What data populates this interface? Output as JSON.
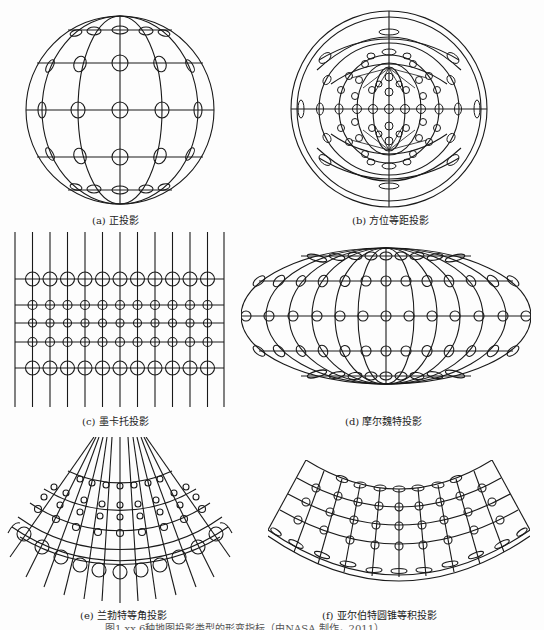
{
  "figure": {
    "caption_partial": "图1.xx 6种地图投影类型的形变指标（由NASA 制作，2011）",
    "stroke_color": "#1a1a1a",
    "background": "#fdfdfd"
  },
  "panels": [
    {
      "id": "a",
      "label": "(a) 正投影",
      "projection": "orthographic"
    },
    {
      "id": "b",
      "label": "(b) 方位等距投影",
      "projection": "azimuthal-equidistant"
    },
    {
      "id": "c",
      "label": "(c) 墨卡托投影",
      "projection": "mercator"
    },
    {
      "id": "d",
      "label": "(d) 摩尔魏特投影",
      "projection": "mollweide"
    },
    {
      "id": "e",
      "label": "(e) 兰勃特等角投影",
      "projection": "lambert-conformal-conic"
    },
    {
      "id": "f",
      "label": "(f) 亚尔伯特圆锥等积投影",
      "projection": "albers-equal-area-conic"
    }
  ]
}
